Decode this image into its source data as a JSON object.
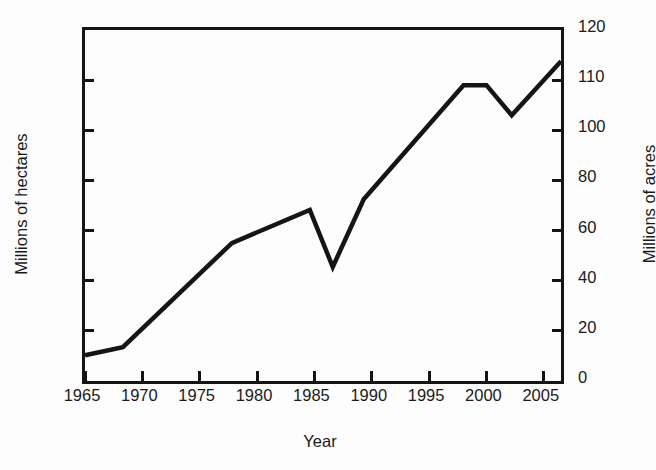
{
  "chart_data": {
    "type": "line",
    "title": "",
    "xlabel": "Year",
    "ylabel": "Millions of hectares",
    "ylabel_secondary": "Millions of acres",
    "grid": false,
    "legend": false,
    "line_color": "#151515",
    "background": "#ffffff",
    "xlim": [
      1965,
      2006.5
    ],
    "ylim": [
      0,
      56
    ],
    "ylim_secondary": [
      0,
      120
    ],
    "xticks": [
      "1965",
      "1970",
      "1975",
      "1980",
      "1985",
      "1990",
      "1995",
      "2000",
      "2005"
    ],
    "xtick_values": [
      1965,
      1970,
      1975,
      1980,
      1985,
      1990,
      1995,
      2000,
      2005
    ],
    "yticks_left": [
      "0",
      "8",
      "16",
      "24",
      "32",
      "40",
      "48",
      "56"
    ],
    "ytick_values_left": [
      0,
      8,
      16,
      24,
      32,
      40,
      48,
      56
    ],
    "yticks_right": [
      "0",
      "20",
      "40",
      "60",
      "80",
      "100",
      "110",
      "120"
    ],
    "series": [
      {
        "name": "Global area of biotech crops",
        "x": [
          1965.0,
          1968.3,
          1977.8,
          1984.6,
          1986.6,
          1989.3,
          1998.0,
          2000.0,
          2002.2,
          2006.5
        ],
        "values": [
          4.1,
          5.4,
          22.0,
          27.3,
          18.2,
          29.0,
          47.2,
          47.2,
          42.4,
          51.0
        ]
      }
    ]
  }
}
